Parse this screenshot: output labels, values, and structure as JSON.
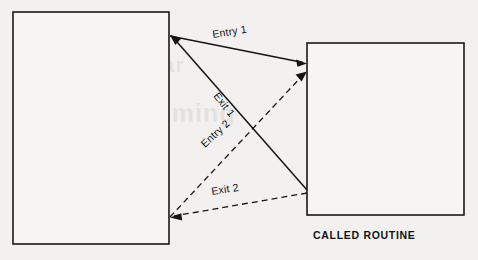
{
  "diagram": {
    "background_color": "#f2f1ef",
    "line_color": "#141414",
    "boxes": [
      {
        "id": "calling-routine",
        "label": "",
        "x": 13,
        "y": 12,
        "width": 156,
        "height": 232
      },
      {
        "id": "called-routine",
        "label": "CALLED ROUTINE",
        "x": 307,
        "y": 43,
        "width": 157,
        "height": 172
      }
    ],
    "captions": [
      {
        "id": "called-routine-caption",
        "text": "CALLED ROUTINE"
      }
    ],
    "edges": [
      {
        "id": "entry-1",
        "label": "Entry 1",
        "style": "solid",
        "direction": "left-to-right",
        "label_rotation": -9,
        "from": {
          "x": 170,
          "y": 36
        },
        "to": {
          "x": 307,
          "y": 63
        }
      },
      {
        "id": "exit-1",
        "label": "Exit 1",
        "style": "solid",
        "direction": "right-to-left",
        "label_rotation": 52,
        "from": {
          "x": 307,
          "y": 190
        },
        "to": {
          "x": 170,
          "y": 36
        }
      },
      {
        "id": "entry-2",
        "label": "Entry 2",
        "style": "dashed",
        "direction": "left-to-right",
        "label_rotation": -43,
        "from": {
          "x": 170,
          "y": 217
        },
        "to": {
          "x": 307,
          "y": 73
        }
      },
      {
        "id": "exit-2",
        "label": "Exit 2",
        "style": "dashed",
        "direction": "right-to-left",
        "label_rotation": -9,
        "from": {
          "x": 307,
          "y": 193
        },
        "to": {
          "x": 170,
          "y": 217
        }
      }
    ],
    "ghost_text": [
      {
        "text": "Modular",
        "x": 96,
        "y": 72,
        "size": 21
      },
      {
        "text": "Programming",
        "x": 62,
        "y": 122,
        "size": 25
      }
    ]
  }
}
